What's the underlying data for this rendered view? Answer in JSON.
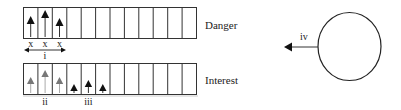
{
  "diagram": {
    "rows": [
      {
        "label": "Danger",
        "cells": 12,
        "arrows": [
          {
            "cell": 0,
            "height": "medium",
            "color": "#111111"
          },
          {
            "cell": 1,
            "height": "tall",
            "color": "#111111"
          },
          {
            "cell": 2,
            "height": "medium",
            "color": "#111111"
          }
        ],
        "cell_marks": [
          "x",
          "x",
          "x"
        ],
        "span_label": "i"
      },
      {
        "label": "Interest",
        "cells": 12,
        "arrows": [
          {
            "cell": 0,
            "height": "medium",
            "color": "#777777"
          },
          {
            "cell": 1,
            "height": "tall",
            "color": "#777777"
          },
          {
            "cell": 2,
            "height": "medium",
            "color": "#777777"
          },
          {
            "cell": 3,
            "height": "short",
            "color": "#111111"
          },
          {
            "cell": 4,
            "height": "medium-short",
            "color": "#111111"
          },
          {
            "cell": 5,
            "height": "short",
            "color": "#111111"
          }
        ],
        "group_labels": [
          {
            "text": "ii",
            "under_cell": 1
          },
          {
            "text": "iii",
            "under_cell": 4
          }
        ]
      }
    ],
    "circle": {
      "arrow_label": "iv",
      "arrow_direction": "left"
    }
  }
}
